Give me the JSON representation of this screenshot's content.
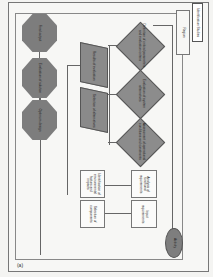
{
  "figure": {
    "panel_label": "(a)",
    "caption_box": "Identification Studies",
    "region_label": "Region"
  },
  "nodes": {
    "start": "Activity",
    "input_1": "Input requirements",
    "input_2": "Analysis of functional requirements",
    "process_1": "Selection of components",
    "process_2": "Identification of environmental factors and impacts",
    "decision_1": "Assessment of operational conditions and constraints",
    "decision_2": "Evaluation of system alternatives",
    "decision_3": "Definition of critical parameters and evaluation criteria",
    "data_1": "Selection of alternatives",
    "data_2": "Results of evaluation",
    "terminal_1": "Optimum design",
    "terminal_2": "Evaluation of solution",
    "terminal_3": "Final output"
  }
}
